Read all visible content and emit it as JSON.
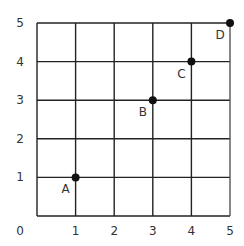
{
  "chart_data": {
    "type": "scatter",
    "title": "",
    "xlabel": "",
    "ylabel": "",
    "xlim": [
      0,
      5
    ],
    "ylim": [
      0,
      5
    ],
    "grid": true,
    "x_ticks": [
      "0",
      "1",
      "2",
      "3",
      "4",
      "5"
    ],
    "y_ticks": [
      "1",
      "2",
      "3",
      "4",
      "5"
    ],
    "points": [
      {
        "label": "A",
        "x": 1,
        "y": 1
      },
      {
        "label": "B",
        "x": 3,
        "y": 3
      },
      {
        "label": "C",
        "x": 4,
        "y": 4
      },
      {
        "label": "D",
        "x": 5,
        "y": 5
      }
    ],
    "colors": {
      "grid": "#222222",
      "point": "#111111",
      "text": "#333333"
    }
  }
}
